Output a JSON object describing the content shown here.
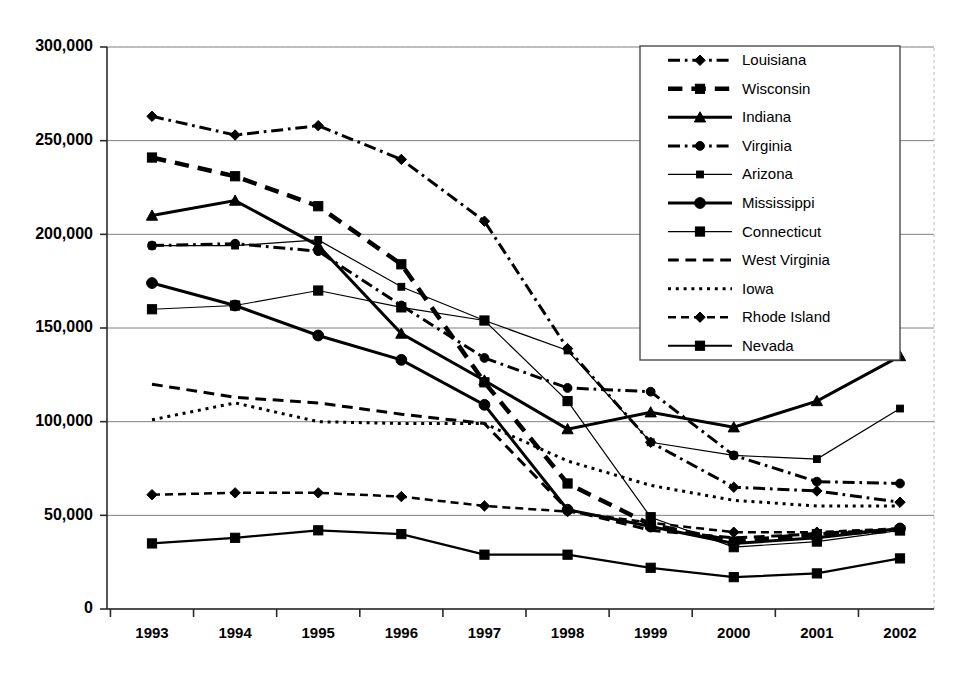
{
  "chart_data": {
    "type": "line",
    "title": "",
    "xlabel": "",
    "ylabel": "",
    "x": [
      "1993",
      "1994",
      "1995",
      "1996",
      "1997",
      "1998",
      "1999",
      "2000",
      "2001",
      "2002"
    ],
    "categories": [
      "1993",
      "1994",
      "1995",
      "1996",
      "1997",
      "1998",
      "1999",
      "2000",
      "2001",
      "2002"
    ],
    "ylim": [
      0,
      300000
    ],
    "ytick_values": [
      0,
      50000,
      100000,
      150000,
      200000,
      250000,
      300000
    ],
    "ytick_labels": [
      "0",
      "50,000",
      "100,000",
      "150,000",
      "200,000",
      "250,000",
      "300,000"
    ],
    "grid": true,
    "legend_position": "top-right",
    "series": [
      {
        "name": "Louisiana",
        "marker": "diamond",
        "dash": "dash-dot",
        "width": 3,
        "values": [
          263000,
          253000,
          258000,
          240000,
          207000,
          139000,
          89000,
          65000,
          63000,
          57000
        ]
      },
      {
        "name": "Wisconsin",
        "marker": "square",
        "dash": "dash",
        "width": 4.5,
        "values": [
          241000,
          231000,
          215000,
          184000,
          121000,
          67000,
          45000,
          36000,
          40000,
          42000
        ]
      },
      {
        "name": "Indiana",
        "marker": "triangle",
        "dash": "solid",
        "width": 3,
        "values": [
          210000,
          218000,
          194000,
          147000,
          122000,
          96000,
          105000,
          97000,
          111000,
          135000
        ]
      },
      {
        "name": "Virginia",
        "marker": "circle",
        "dash": "dash-dot",
        "width": 3,
        "values": [
          194000,
          195000,
          191000,
          162000,
          134000,
          118000,
          116000,
          82000,
          68000,
          67000
        ]
      },
      {
        "name": "Arizona",
        "marker": "small-square",
        "dash": "solid",
        "width": 1.2,
        "values": [
          194000,
          194000,
          197000,
          172000,
          154000,
          138000,
          89000,
          82000,
          80000,
          107000
        ]
      },
      {
        "name": "Mississippi",
        "marker": "circle-large",
        "dash": "solid",
        "width": 3,
        "values": [
          174000,
          162000,
          146000,
          133000,
          109000,
          53000,
          44000,
          35000,
          38000,
          43000
        ]
      },
      {
        "name": "Connecticut",
        "marker": "square",
        "dash": "solid",
        "width": 1.2,
        "values": [
          160000,
          162000,
          170000,
          161000,
          154000,
          111000,
          49000,
          33000,
          36000,
          42000
        ]
      },
      {
        "name": "West Virginia",
        "marker": "none",
        "dash": "long-dash",
        "width": 3,
        "values": [
          120000,
          113000,
          110000,
          104000,
          99000,
          53000,
          42000,
          38000,
          40000,
          42000
        ]
      },
      {
        "name": "Iowa",
        "marker": "none",
        "dash": "dot",
        "width": 3,
        "values": [
          101000,
          110000,
          100000,
          99000,
          99000,
          79000,
          66000,
          58000,
          55000,
          55000
        ]
      },
      {
        "name": "Rhode Island",
        "marker": "diamond",
        "dash": "dash",
        "width": 2.5,
        "values": [
          61000,
          62000,
          62000,
          60000,
          55000,
          52000,
          46000,
          41000,
          41000,
          43000
        ]
      },
      {
        "name": "Nevada",
        "marker": "square",
        "dash": "solid",
        "width": 2.2,
        "values": [
          35000,
          38000,
          42000,
          40000,
          29000,
          29000,
          22000,
          17000,
          19000,
          27000
        ]
      }
    ]
  },
  "legend": {
    "items": [
      {
        "label": "Louisiana"
      },
      {
        "label": "Wisconsin"
      },
      {
        "label": "Indiana"
      },
      {
        "label": "Virginia"
      },
      {
        "label": "Arizona"
      },
      {
        "label": "Mississippi"
      },
      {
        "label": "Connecticut"
      },
      {
        "label": "West Virginia"
      },
      {
        "label": "Iowa"
      },
      {
        "label": "Rhode Island"
      },
      {
        "label": "Nevada"
      }
    ]
  },
  "colors": {
    "series": "#000000",
    "grid": "#808080",
    "axis": "#2b2b2b",
    "background": "#ffffff"
  }
}
